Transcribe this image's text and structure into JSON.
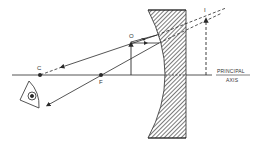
{
  "diagram": {
    "labels": {
      "center_of_curvature": "C",
      "focus": "F",
      "object": "O",
      "image": "I",
      "axis_line1": "PRINCIPAL",
      "axis_line2": "AXIS"
    },
    "elements": {
      "mirror": "convex-mirror (hatched back)",
      "eye": "eye-icon (observer)",
      "object_arrow": "upright object",
      "image_arrow": "upright virtual image (dashed)"
    },
    "colors": {
      "ink": "#2a2a2a",
      "background": "#ffffff"
    }
  }
}
